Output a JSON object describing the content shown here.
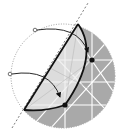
{
  "diagram": {
    "colors": {
      "background": "#ffffff",
      "shaded_region": "#a9a9a9",
      "lattice_lines": "#ffffff",
      "light_region": "#efefef",
      "stroke": "#111111",
      "dotted": "#777777"
    },
    "elements": {
      "circle": {
        "cx": 63,
        "cy": 76,
        "r": 52
      },
      "fold_line": {
        "x1": 12,
        "y1": 128,
        "x2": 88,
        "y2": 3
      },
      "chord": {
        "x1": 24,
        "y1": 110,
        "x2": 78,
        "y2": 24
      },
      "open_points": [
        {
          "x": 35,
          "y": 30
        },
        {
          "x": 10,
          "y": 74
        }
      ],
      "filled_points": [
        {
          "x": 92,
          "y": 60
        },
        {
          "x": 65,
          "y": 105
        }
      ]
    }
  }
}
